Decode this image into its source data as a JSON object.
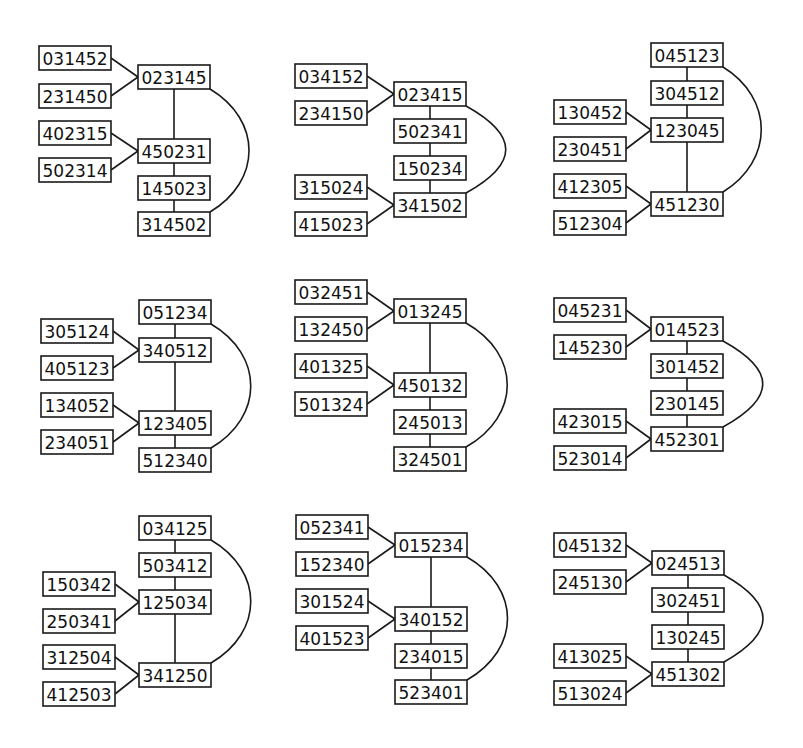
{
  "diagram": {
    "title": "",
    "box_size": {
      "w": 72,
      "h": 24
    },
    "colors": {
      "stroke": "#1a1a1a",
      "text": "#111111",
      "background": "#ffffff"
    },
    "panels": [
      {
        "id": "panel-1",
        "nodes": [
          {
            "label": "031452",
            "x": 39,
            "y": 46
          },
          {
            "label": "231450",
            "x": 39,
            "y": 84
          },
          {
            "label": "023145",
            "x": 138,
            "y": 65
          },
          {
            "label": "402315",
            "x": 39,
            "y": 121
          },
          {
            "label": "502314",
            "x": 39,
            "y": 158
          },
          {
            "label": "450231",
            "x": 138,
            "y": 139
          },
          {
            "label": "145023",
            "x": 138,
            "y": 176
          },
          {
            "label": "314502",
            "x": 138,
            "y": 212
          }
        ],
        "edges": [
          [
            0,
            2
          ],
          [
            1,
            2
          ],
          [
            3,
            5
          ],
          [
            4,
            5
          ],
          [
            2,
            5
          ],
          [
            5,
            6
          ],
          [
            6,
            7
          ]
        ],
        "arc": {
          "from": 2,
          "to": 7,
          "bulge_x": 248
        }
      },
      {
        "id": "panel-2",
        "nodes": [
          {
            "label": "034152",
            "x": 295,
            "y": 64
          },
          {
            "label": "234150",
            "x": 295,
            "y": 101
          },
          {
            "label": "023415",
            "x": 394,
            "y": 82
          },
          {
            "label": "502341",
            "x": 394,
            "y": 119
          },
          {
            "label": "150234",
            "x": 394,
            "y": 156
          },
          {
            "label": "315024",
            "x": 295,
            "y": 175
          },
          {
            "label": "415023",
            "x": 295,
            "y": 212
          },
          {
            "label": "341502",
            "x": 394,
            "y": 193
          }
        ],
        "edges": [
          [
            0,
            2
          ],
          [
            1,
            2
          ],
          [
            2,
            3
          ],
          [
            3,
            4
          ],
          [
            4,
            7
          ],
          [
            5,
            7
          ],
          [
            6,
            7
          ]
        ],
        "arc": {
          "from": 2,
          "to": 7,
          "bulge_x": 505
        }
      },
      {
        "id": "panel-3",
        "nodes": [
          {
            "label": "045123",
            "x": 651,
            "y": 43
          },
          {
            "label": "304512",
            "x": 651,
            "y": 81
          },
          {
            "label": "130452",
            "x": 554,
            "y": 100
          },
          {
            "label": "230451",
            "x": 554,
            "y": 137
          },
          {
            "label": "123045",
            "x": 651,
            "y": 118
          },
          {
            "label": "412305",
            "x": 554,
            "y": 174
          },
          {
            "label": "512304",
            "x": 554,
            "y": 211
          },
          {
            "label": "451230",
            "x": 651,
            "y": 192
          }
        ],
        "edges": [
          [
            0,
            1
          ],
          [
            1,
            4
          ],
          [
            2,
            4
          ],
          [
            3,
            4
          ],
          [
            4,
            7
          ],
          [
            5,
            7
          ],
          [
            6,
            7
          ]
        ],
        "arc": {
          "from": 0,
          "to": 7,
          "bulge_x": 760
        }
      },
      {
        "id": "panel-4",
        "nodes": [
          {
            "label": "051234",
            "x": 139,
            "y": 300
          },
          {
            "label": "305124",
            "x": 41,
            "y": 319
          },
          {
            "label": "405123",
            "x": 41,
            "y": 356
          },
          {
            "label": "340512",
            "x": 139,
            "y": 338
          },
          {
            "label": "134052",
            "x": 41,
            "y": 393
          },
          {
            "label": "234051",
            "x": 41,
            "y": 430
          },
          {
            "label": "123405",
            "x": 139,
            "y": 411
          },
          {
            "label": "512340",
            "x": 139,
            "y": 448
          }
        ],
        "edges": [
          [
            0,
            3
          ],
          [
            1,
            3
          ],
          [
            2,
            3
          ],
          [
            3,
            6
          ],
          [
            4,
            6
          ],
          [
            5,
            6
          ],
          [
            6,
            7
          ]
        ],
        "arc": {
          "from": 0,
          "to": 7,
          "bulge_x": 250
        }
      },
      {
        "id": "panel-5",
        "nodes": [
          {
            "label": "032451",
            "x": 295,
            "y": 280
          },
          {
            "label": "132450",
            "x": 295,
            "y": 317
          },
          {
            "label": "013245",
            "x": 394,
            "y": 299
          },
          {
            "label": "401325",
            "x": 295,
            "y": 354
          },
          {
            "label": "501324",
            "x": 295,
            "y": 392
          },
          {
            "label": "450132",
            "x": 394,
            "y": 373
          },
          {
            "label": "245013",
            "x": 394,
            "y": 410
          },
          {
            "label": "324501",
            "x": 394,
            "y": 447
          }
        ],
        "edges": [
          [
            0,
            2
          ],
          [
            1,
            2
          ],
          [
            2,
            5
          ],
          [
            3,
            5
          ],
          [
            4,
            5
          ],
          [
            5,
            6
          ],
          [
            6,
            7
          ]
        ],
        "arc": {
          "from": 2,
          "to": 7,
          "bulge_x": 507
        }
      },
      {
        "id": "panel-6",
        "nodes": [
          {
            "label": "045231",
            "x": 554,
            "y": 298
          },
          {
            "label": "145230",
            "x": 554,
            "y": 335
          },
          {
            "label": "014523",
            "x": 651,
            "y": 317
          },
          {
            "label": "301452",
            "x": 651,
            "y": 354
          },
          {
            "label": "230145",
            "x": 651,
            "y": 391
          },
          {
            "label": "423015",
            "x": 554,
            "y": 409
          },
          {
            "label": "523014",
            "x": 554,
            "y": 446
          },
          {
            "label": "452301",
            "x": 651,
            "y": 427
          }
        ],
        "edges": [
          [
            0,
            2
          ],
          [
            1,
            2
          ],
          [
            2,
            3
          ],
          [
            3,
            4
          ],
          [
            4,
            7
          ],
          [
            5,
            7
          ],
          [
            6,
            7
          ]
        ],
        "arc": {
          "from": 2,
          "to": 7,
          "bulge_x": 762
        }
      },
      {
        "id": "panel-7",
        "nodes": [
          {
            "label": "034125",
            "x": 139,
            "y": 516
          },
          {
            "label": "503412",
            "x": 139,
            "y": 553
          },
          {
            "label": "150342",
            "x": 43,
            "y": 572
          },
          {
            "label": "250341",
            "x": 43,
            "y": 609
          },
          {
            "label": "125034",
            "x": 139,
            "y": 590
          },
          {
            "label": "312504",
            "x": 43,
            "y": 645
          },
          {
            "label": "412503",
            "x": 43,
            "y": 682
          },
          {
            "label": "341250",
            "x": 139,
            "y": 663
          }
        ],
        "edges": [
          [
            0,
            1
          ],
          [
            1,
            4
          ],
          [
            2,
            4
          ],
          [
            3,
            4
          ],
          [
            4,
            7
          ],
          [
            5,
            7
          ],
          [
            6,
            7
          ]
        ],
        "arc": {
          "from": 0,
          "to": 7,
          "bulge_x": 250
        }
      },
      {
        "id": "panel-8",
        "nodes": [
          {
            "label": "052341",
            "x": 296,
            "y": 515
          },
          {
            "label": "152340",
            "x": 296,
            "y": 552
          },
          {
            "label": "015234",
            "x": 395,
            "y": 533
          },
          {
            "label": "301524",
            "x": 296,
            "y": 589
          },
          {
            "label": "401523",
            "x": 296,
            "y": 626
          },
          {
            "label": "340152",
            "x": 395,
            "y": 607
          },
          {
            "label": "234015",
            "x": 395,
            "y": 644
          },
          {
            "label": "523401",
            "x": 395,
            "y": 680
          }
        ],
        "edges": [
          [
            0,
            2
          ],
          [
            1,
            2
          ],
          [
            2,
            5
          ],
          [
            3,
            5
          ],
          [
            4,
            5
          ],
          [
            5,
            6
          ],
          [
            6,
            7
          ]
        ],
        "arc": {
          "from": 2,
          "to": 7,
          "bulge_x": 507
        }
      },
      {
        "id": "panel-9",
        "nodes": [
          {
            "label": "045132",
            "x": 554,
            "y": 533
          },
          {
            "label": "245130",
            "x": 554,
            "y": 570
          },
          {
            "label": "024513",
            "x": 652,
            "y": 551
          },
          {
            "label": "302451",
            "x": 652,
            "y": 588
          },
          {
            "label": "130245",
            "x": 652,
            "y": 625
          },
          {
            "label": "413025",
            "x": 554,
            "y": 644
          },
          {
            "label": "513024",
            "x": 554,
            "y": 681
          },
          {
            "label": "451302",
            "x": 652,
            "y": 662
          }
        ],
        "edges": [
          [
            0,
            2
          ],
          [
            1,
            2
          ],
          [
            2,
            3
          ],
          [
            3,
            4
          ],
          [
            4,
            7
          ],
          [
            5,
            7
          ],
          [
            6,
            7
          ]
        ],
        "arc": {
          "from": 2,
          "to": 7,
          "bulge_x": 762
        }
      }
    ]
  }
}
